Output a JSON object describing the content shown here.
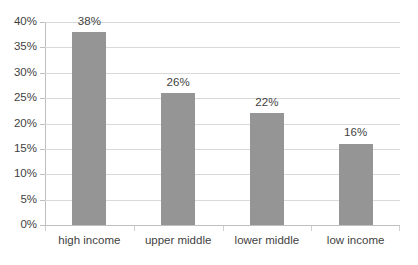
{
  "chart_data": {
    "type": "bar",
    "title": "",
    "subtitle": "",
    "xlabel": "",
    "ylabel": "",
    "categories": [
      "high income",
      "upper middle",
      "lower middle",
      "low income"
    ],
    "values": [
      38,
      26,
      22,
      16
    ],
    "data_labels": [
      "38%",
      "26%",
      "22%",
      "16%"
    ],
    "ylim": [
      0,
      40
    ],
    "y_ticks": [
      0,
      5,
      10,
      15,
      20,
      25,
      30,
      35,
      40
    ],
    "y_tick_labels": [
      "0%",
      "5%",
      "10%",
      "15%",
      "20%",
      "25%",
      "30%",
      "35%",
      "40%"
    ],
    "grid": true,
    "legend": false,
    "legend_position": "none",
    "series": [
      {
        "name": "",
        "values": [
          38,
          26,
          22,
          16
        ]
      }
    ],
    "colors": {
      "bar_fill": "#959595",
      "gridline": "#d9d9d9",
      "axis_line": "#bfbfbf",
      "text": "#3f3f3f",
      "background": "#ffffff"
    }
  }
}
